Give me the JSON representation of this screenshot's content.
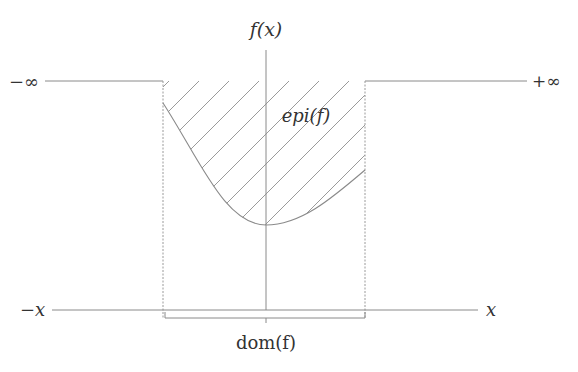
{
  "diagram": {
    "labels": {
      "y_axis": "f(x)",
      "neg_inf": "−∞",
      "pos_inf": "+∞",
      "epigraph": "epi(f)",
      "neg_x": "−x",
      "x": "x",
      "domain": "dom(f)"
    },
    "colors": {
      "line": "#8a8a8a",
      "text": "#333333",
      "hatch": "#9a9a9a"
    },
    "geometry": {
      "domain_left_x": 163,
      "domain_right_x": 365,
      "top_level_y": 81,
      "x_axis_y": 310,
      "y_axis_x": 266,
      "curve_min": [
        266,
        225
      ]
    }
  }
}
